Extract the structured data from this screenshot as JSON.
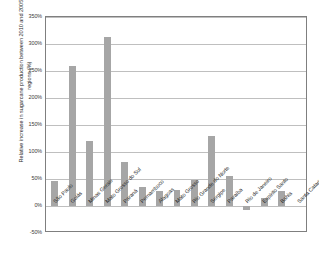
{
  "chart_data": {
    "type": "bar",
    "title": "",
    "subtitle": "",
    "xlabel": "",
    "ylabel": "Relative increase in sugarcane production between 2010 and 2005, per regions (%)",
    "ylim": [
      -50,
      350
    ],
    "ytick_labels": [
      "350%",
      "300%",
      "250%",
      "200%",
      "150%",
      "100%",
      "50%",
      "0%",
      "-50%"
    ],
    "ytick_values": [
      350,
      300,
      250,
      200,
      150,
      100,
      50,
      0,
      -50
    ],
    "grid": true,
    "legend": "none",
    "bar_color": "#a6a6a6",
    "categories": [
      "São Paulo",
      "Goiás",
      "Minas Gerais",
      "Mato Grosso do Sul",
      "Paraná",
      "Pernambuco",
      "Alagoas",
      "Mato Grosso",
      "Rio Grande do Norte",
      "Sergipe",
      "Paraíba",
      "Rio de Janeiro",
      "Espírito Santo",
      "Bahia",
      "Santa Catarina"
    ],
    "values": [
      46,
      260,
      121,
      313,
      82,
      35,
      27,
      29,
      49,
      129,
      56,
      -8,
      14,
      28,
      0
    ]
  }
}
